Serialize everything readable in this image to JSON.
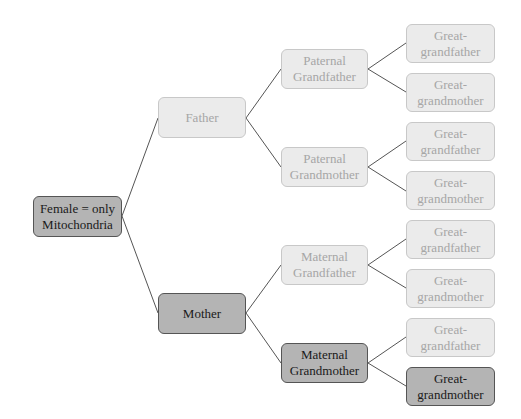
{
  "colors": {
    "light_fill": "#ebebeb",
    "light_border": "#c8c8c8",
    "light_text": "#a6a6a6",
    "dark_fill": "#b4b4b4",
    "dark_border": "#555555",
    "dark_text": "#1a1a1a",
    "link": "#555555"
  },
  "nodes": {
    "root": {
      "line1": "Female = only",
      "line2": "Mitochondria"
    },
    "father": {
      "line1": "Father"
    },
    "mother": {
      "line1": "Mother"
    },
    "paternal_grandfather": {
      "line1": "Paternal",
      "line2": "Grandfather"
    },
    "paternal_grandmother": {
      "line1": "Paternal",
      "line2": "Grandmother"
    },
    "maternal_grandfather": {
      "line1": "Maternal",
      "line2": "Grandfather"
    },
    "maternal_grandmother": {
      "line1": "Maternal",
      "line2": "Grandmother"
    },
    "leaves": [
      {
        "line1": "Great-",
        "line2": "grandfather"
      },
      {
        "line1": "Great-",
        "line2": "grandmother"
      },
      {
        "line1": "Great-",
        "line2": "grandfather"
      },
      {
        "line1": "Great-",
        "line2": "grandmother"
      },
      {
        "line1": "Great-",
        "line2": "grandfather"
      },
      {
        "line1": "Great-",
        "line2": "grandmother"
      },
      {
        "line1": "Great-",
        "line2": "grandfather"
      },
      {
        "line1": "Great-",
        "line2": "grandmother"
      }
    ]
  }
}
